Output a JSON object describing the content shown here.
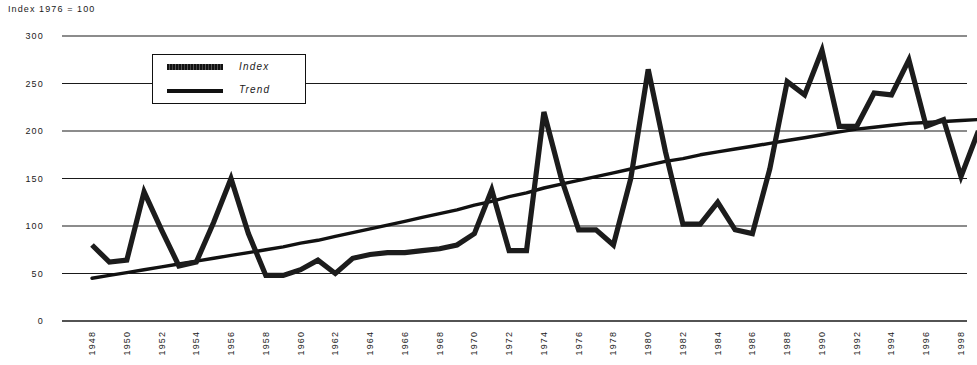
{
  "chart_title": "Index 1976 = 100",
  "legend": {
    "position": "inside-top-left",
    "entries": [
      {
        "label": "Index",
        "style": "textured-thick-line",
        "color": "#1c1c1c"
      },
      {
        "label": "Trend",
        "style": "solid-line",
        "color": "#111111"
      }
    ]
  },
  "axis": {
    "y_ticks": [
      "300",
      "250",
      "200",
      "150",
      "100",
      "50",
      "0"
    ],
    "x_ticks": [
      "1948",
      "1950",
      "1952",
      "1954",
      "1956",
      "1958",
      "1960",
      "1962",
      "1964",
      "1966",
      "1968",
      "1970",
      "1972",
      "1974",
      "1976",
      "1978",
      "1980",
      "1982",
      "1984",
      "1986",
      "1988",
      "1990",
      "1992",
      "1994",
      "1996",
      "1998"
    ]
  },
  "chart_data": {
    "type": "line",
    "title": "Index 1976 = 100",
    "xlabel": "",
    "ylabel": "Index 1976 = 100",
    "ylim": [
      0,
      300
    ],
    "xlim": [
      1948,
      1999
    ],
    "grid": true,
    "legend_position": "inside-top-left",
    "x": [
      1948,
      1949,
      1950,
      1951,
      1952,
      1953,
      1954,
      1955,
      1956,
      1957,
      1958,
      1959,
      1960,
      1961,
      1962,
      1963,
      1964,
      1965,
      1966,
      1967,
      1968,
      1969,
      1970,
      1971,
      1972,
      1973,
      1974,
      1975,
      1976,
      1977,
      1978,
      1979,
      1980,
      1981,
      1982,
      1983,
      1984,
      1985,
      1986,
      1987,
      1988,
      1989,
      1990,
      1991,
      1992,
      1993,
      1994,
      1995,
      1996,
      1997,
      1998,
      1999
    ],
    "series": [
      {
        "name": "Index",
        "values": [
          80,
          62,
          64,
          136,
          96,
          58,
          62,
          104,
          150,
          92,
          48,
          48,
          54,
          64,
          50,
          66,
          70,
          72,
          72,
          74,
          76,
          80,
          92,
          138,
          74,
          74,
          220,
          150,
          96,
          96,
          80,
          150,
          265,
          178,
          102,
          102,
          125,
          96,
          92,
          160,
          252,
          238,
          285,
          205,
          205,
          240,
          238,
          275,
          205,
          212,
          152,
          200
        ]
      },
      {
        "name": "Trend",
        "values": [
          45,
          48,
          51,
          54,
          57,
          60,
          63,
          66,
          69,
          72,
          75,
          78,
          82,
          85,
          89,
          93,
          97,
          101,
          105,
          109,
          113,
          117,
          122,
          126,
          131,
          135,
          140,
          144,
          148,
          152,
          156,
          160,
          164,
          168,
          171,
          175,
          178,
          181,
          184,
          187,
          190,
          193,
          196,
          199,
          202,
          204,
          206,
          208,
          209,
          210,
          211,
          212
        ]
      }
    ]
  }
}
